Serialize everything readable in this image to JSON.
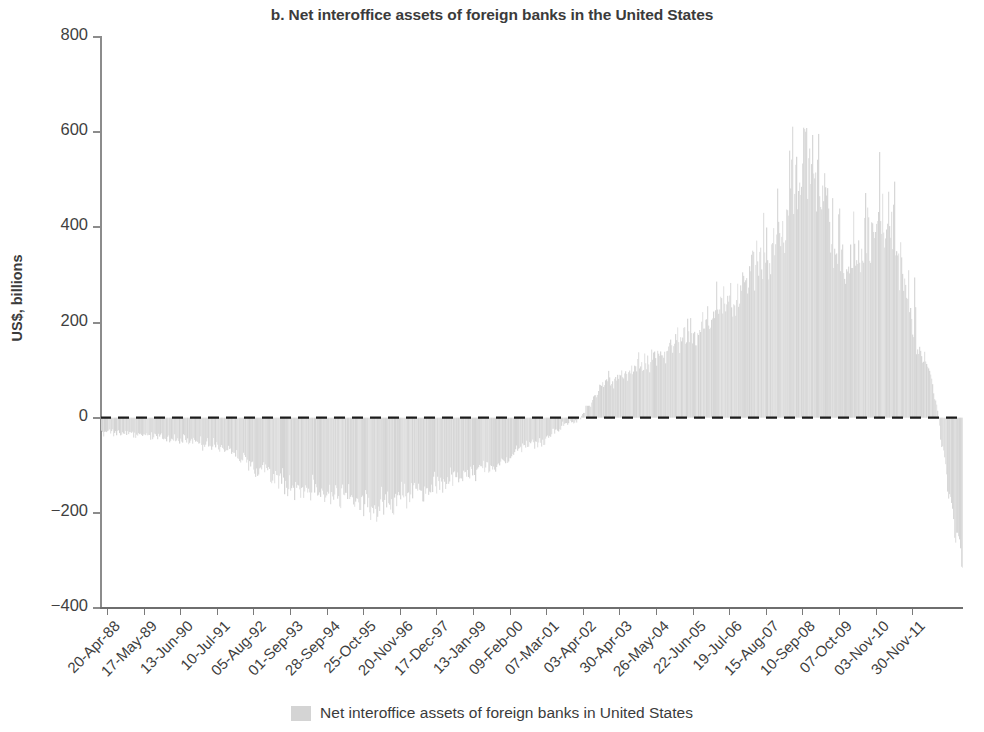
{
  "chart_data": {
    "type": "area",
    "title": "b. Net interoffice assets of foreign banks in the United States",
    "xlabel": "",
    "ylabel": "US$, billions",
    "ylim": [
      -400,
      800
    ],
    "yticks": [
      800,
      600,
      400,
      200,
      0,
      -200,
      -400
    ],
    "ytick_labels": [
      "800",
      "600",
      "400",
      "200",
      "0",
      "−200",
      "−400"
    ],
    "grid": false,
    "zero_line": true,
    "zero_line_style": "dashed",
    "legend_position": "bottom-center",
    "series": [
      {
        "name": "Net interoffice assets of foreign banks in United States",
        "color": "#d4d4d4",
        "x": [
          "20-Apr-88",
          "17-May-89",
          "13-Jun-90",
          "10-Jul-91",
          "05-Aug-92",
          "01-Sep-93",
          "28-Sep-94",
          "25-Oct-95",
          "20-Nov-96",
          "17-Dec-97",
          "13-Jan-99",
          "09-Feb-00",
          "07-Mar-01",
          "03-Apr-02",
          "30-Apr-03",
          "26-May-04",
          "22-Jun-05",
          "19-Jul-06",
          "15-Aug-07",
          "10-Sep-08",
          "07-Oct-09",
          "03-Nov-10",
          "30-Nov-11"
        ],
        "values": [
          -30,
          -35,
          -45,
          -60,
          -105,
          -150,
          -160,
          -185,
          -155,
          -130,
          -100,
          -55,
          -10,
          80,
          120,
          175,
          230,
          330,
          520,
          300,
          400,
          120,
          -230
        ]
      }
    ],
    "annotations": [
      {
        "label": "peak",
        "value": 635,
        "near": "15-Aug-07"
      },
      {
        "label": "secondary peak",
        "value": 610,
        "near": "10-Sep-08"
      },
      {
        "label": "trough (early)",
        "value": -205,
        "near": "25-Oct-95"
      },
      {
        "label": "trough (final)",
        "value": -290,
        "near": "30-Nov-11"
      }
    ]
  },
  "xticks": [
    "20-Apr-88",
    "17-May-89",
    "13-Jun-90",
    "10-Jul-91",
    "05-Aug-92",
    "01-Sep-93",
    "28-Sep-94",
    "25-Oct-95",
    "20-Nov-96",
    "17-Dec-97",
    "13-Jan-99",
    "09-Feb-00",
    "07-Mar-01",
    "03-Apr-02",
    "30-Apr-03",
    "26-May-04",
    "22-Jun-05",
    "19-Jul-06",
    "15-Aug-07",
    "10-Sep-08",
    "07-Oct-09",
    "03-Nov-10",
    "30-Nov-11"
  ],
  "legend": {
    "label": "Net interoffice assets of foreign banks in United States",
    "swatch_color": "#d4d4d4"
  },
  "colors": {
    "series_fill": "#d4d4d4",
    "axis": "#8c8c8c",
    "text": "#3b3b3b",
    "zero_line": "#1c1c1c"
  }
}
